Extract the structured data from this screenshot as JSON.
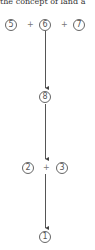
{
  "caption": "the concept of land a",
  "nodes": {
    "n5": "5",
    "n6": "6",
    "n7": "7",
    "n8": "8",
    "n2": "2",
    "n3": "3",
    "n1": "1"
  },
  "operators": {
    "plus": "+"
  },
  "diagram": {
    "rows": [
      {
        "expr": [
          "5",
          "+",
          "6",
          "+",
          "7"
        ]
      },
      {
        "expr": [
          "8"
        ]
      },
      {
        "expr": [
          "2",
          "+",
          "3"
        ]
      },
      {
        "expr": [
          "1"
        ]
      }
    ],
    "arrows": [
      [
        "row1",
        "row2"
      ],
      [
        "row2",
        "row3"
      ],
      [
        "row3",
        "row4"
      ]
    ]
  }
}
